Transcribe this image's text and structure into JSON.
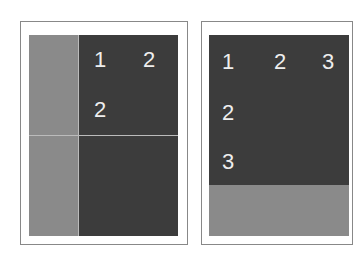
{
  "left_panel": {
    "labels": [
      {
        "text": "1",
        "x": 94,
        "y": 49
      },
      {
        "text": "2",
        "x": 143,
        "y": 49
      },
      {
        "text": "2",
        "x": 94,
        "y": 99
      }
    ]
  },
  "right_panel": {
    "labels": [
      {
        "text": "1",
        "x": 222,
        "y": 51
      },
      {
        "text": "2",
        "x": 274,
        "y": 51
      },
      {
        "text": "3",
        "x": 322,
        "y": 51
      },
      {
        "text": "2",
        "x": 222,
        "y": 102
      },
      {
        "text": "3",
        "x": 222,
        "y": 151
      }
    ]
  },
  "colors": {
    "dark": "#3c3c3c",
    "gray": "#8a8a8a"
  }
}
